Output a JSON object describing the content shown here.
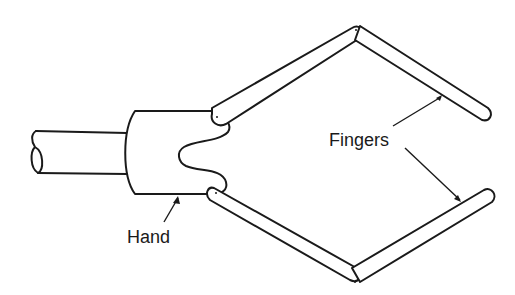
{
  "diagram": {
    "type": "robot-gripper-line-art",
    "labels": {
      "hand": "Hand",
      "fingers": "Fingers"
    },
    "parts": [
      "arm",
      "hand",
      "upper-finger-proximal",
      "upper-finger-distal",
      "lower-finger-proximal",
      "lower-finger-distal"
    ],
    "colors": {
      "line": "#1a1a1a",
      "background": "#ffffff"
    }
  }
}
